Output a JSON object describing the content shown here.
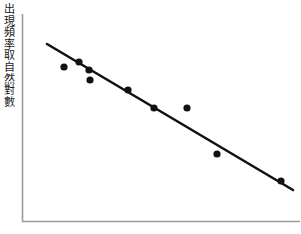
{
  "figure": {
    "background_color": "#ffffff",
    "ink_color": "#111111",
    "axis_color": "#9a9a9a"
  },
  "axes": {
    "y_axis_label": "出現頻率取自然對數",
    "x_axis_label": "",
    "x_tick_labels": [],
    "y_tick_labels": [],
    "grid": false,
    "y_axis_line_x": 22,
    "y_axis_line_top": 14,
    "y_axis_line_bottom": 222,
    "x_axis_line_y": 222,
    "x_axis_line_left": 22,
    "x_axis_line_right": 300
  },
  "chart_data": {
    "type": "scatter",
    "title": "",
    "subtitle": "",
    "xlabel": "",
    "ylabel": "出現頻率取自然對數",
    "grid": false,
    "legend": null,
    "xlim": [
      0,
      10
    ],
    "ylim": [
      0,
      10
    ],
    "points": [
      {
        "px": 64,
        "py": 67,
        "x": 1.51,
        "y": 7.45
      },
      {
        "px": 79,
        "py": 62,
        "x": 2.05,
        "y": 7.69
      },
      {
        "px": 89,
        "py": 70,
        "x": 2.41,
        "y": 7.31
      },
      {
        "px": 90,
        "py": 80,
        "x": 2.45,
        "y": 6.83
      },
      {
        "px": 128,
        "py": 90,
        "x": 3.81,
        "y": 6.35
      },
      {
        "px": 154,
        "py": 108,
        "x": 4.75,
        "y": 5.48
      },
      {
        "px": 187,
        "py": 108,
        "x": 5.94,
        "y": 5.48
      },
      {
        "px": 217,
        "py": 154,
        "x": 7.01,
        "y": 3.27
      },
      {
        "px": 281,
        "py": 181,
        "x": 9.32,
        "y": 1.97
      }
    ],
    "trendline": {
      "label": "",
      "x_start_px": 47,
      "y_start_px": 44,
      "x_end_px": 293,
      "y_end_px": 190,
      "x_start": 0.9,
      "y_start": 8.56,
      "x_end": 9.75,
      "y_end": 1.54,
      "slope": -0.79,
      "direction": "negative"
    },
    "marker": {
      "shape": "circle",
      "radius_px": 3.6,
      "color": "#111111"
    },
    "line_style": {
      "color": "#111111",
      "width_px": 2.6
    }
  }
}
